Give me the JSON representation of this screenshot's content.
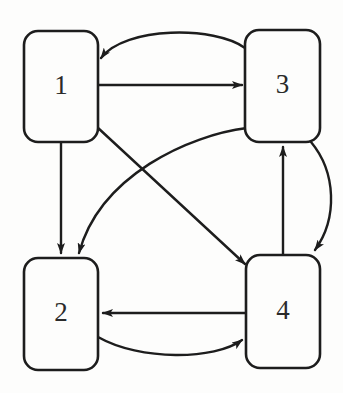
{
  "diagram": {
    "type": "directed-graph",
    "title": "",
    "background_color": "#fdfdfc",
    "stroke_color": "#1d1d1d",
    "node_fill_color": "#fdfdfc",
    "label_color": "#2a2a2a",
    "nodes": [
      {
        "id": "1",
        "label": "1",
        "x": 24,
        "y": 31,
        "width": 74,
        "height": 111,
        "rx": 14
      },
      {
        "id": "3",
        "label": "3",
        "x": 245,
        "y": 30,
        "width": 75,
        "height": 112,
        "rx": 14
      },
      {
        "id": "2",
        "label": "2",
        "x": 24,
        "y": 258,
        "width": 74,
        "height": 112,
        "rx": 14
      },
      {
        "id": "4",
        "label": "4",
        "x": 246,
        "y": 255,
        "width": 74,
        "height": 113,
        "rx": 14
      }
    ],
    "edges": [
      {
        "id": "e-3-1",
        "from": "3",
        "to": "1",
        "style": "curved",
        "label": "",
        "path": "M 245 48 C 215 26 125 26 101 58"
      },
      {
        "id": "e-1-3",
        "from": "1",
        "to": "3",
        "style": "straight",
        "label": "",
        "path": "M 98 85 L 242 85"
      },
      {
        "id": "e-1-2",
        "from": "1",
        "to": "2",
        "style": "straight",
        "label": "",
        "path": "M 61 142 L 61 253"
      },
      {
        "id": "e-1-4",
        "from": "1",
        "to": "4",
        "style": "straight",
        "label": "",
        "path": "M 97 127 L 245 264"
      },
      {
        "id": "e-3-2",
        "from": "3",
        "to": "2",
        "style": "curved",
        "label": "",
        "path": "M 247 128 C 190 135 100 175 79 253"
      },
      {
        "id": "e-4-3",
        "from": "4",
        "to": "3",
        "style": "straight",
        "label": "",
        "path": "M 283 255 L 283 147"
      },
      {
        "id": "e-3-4",
        "from": "3",
        "to": "4",
        "style": "curved",
        "label": "",
        "path": "M 311 142 C 336 172 338 218 315 250"
      },
      {
        "id": "e-4-2",
        "from": "4",
        "to": "2",
        "style": "straight",
        "label": "",
        "path": "M 246 313 L 103 313"
      },
      {
        "id": "e-2-4",
        "from": "2",
        "to": "4",
        "style": "curved",
        "label": "",
        "path": "M 98 337 C 140 361 215 360 242 340"
      }
    ],
    "arrowhead": {
      "name": "arrowhead-marker",
      "width": 11,
      "height": 8
    }
  }
}
